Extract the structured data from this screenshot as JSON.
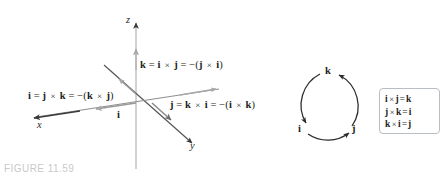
{
  "figure": {
    "caption": "FIGURE 11.59",
    "caption_color": "#c9c9c9"
  },
  "axes_diagram": {
    "axis_labels": {
      "z": "z",
      "x": "x",
      "y": "y"
    },
    "unit_vector_label": "i",
    "equations": {
      "k": {
        "lhs": "k",
        "eq1": "=",
        "a1": "i",
        "cross1": "×",
        "a2": "j",
        "eq2": "=",
        "neg": "−(",
        "b1": "j",
        "cross2": "×",
        "b2": "i",
        "close": ")",
        "plain": "k = i × j = −(j × i)"
      },
      "i": {
        "lhs": "i",
        "eq1": "=",
        "a1": "j",
        "cross1": "×",
        "a2": "k",
        "eq2": "=",
        "neg": "−(",
        "b1": "k",
        "cross2": "×",
        "b2": "j",
        "close": ")",
        "plain": "i = j × k = −(k × j)"
      },
      "j": {
        "lhs": "j",
        "eq1": "=",
        "a1": "k",
        "cross1": "×",
        "a2": "i",
        "eq2": "=",
        "neg": "−(",
        "b1": "i",
        "cross2": "×",
        "b2": "k",
        "close": ")",
        "plain": "j = k × i = −(i × k)"
      }
    },
    "colors": {
      "axis_line": "#b7b7b7",
      "x_axis_line": "#8f8f8f",
      "y_axis_line": "#555555",
      "unit_arrow": "#9a9a9a"
    }
  },
  "cycle_diagram": {
    "nodes": [
      {
        "label": "k",
        "position": "top"
      },
      {
        "label": "i",
        "position": "bottom-left"
      },
      {
        "label": "j",
        "position": "bottom-right"
      }
    ],
    "arcs": [
      {
        "from": "k",
        "to": "i"
      },
      {
        "from": "i",
        "to": "j"
      },
      {
        "from": "j",
        "to": "k"
      }
    ],
    "stroke_color": "#2b2b2b"
  },
  "identity_box": {
    "border_color": "#b9bec4",
    "rows": [
      {
        "a": "i",
        "cross": "×",
        "b": "j",
        "eq": "=",
        "result": "k",
        "plain": "i × j = k"
      },
      {
        "a": "j",
        "cross": "×",
        "b": "k",
        "eq": "=",
        "result": "i",
        "plain": "j × k = i"
      },
      {
        "a": "k",
        "cross": "×",
        "b": "i",
        "eq": "=",
        "result": "j",
        "plain": "k × i = j"
      }
    ]
  }
}
